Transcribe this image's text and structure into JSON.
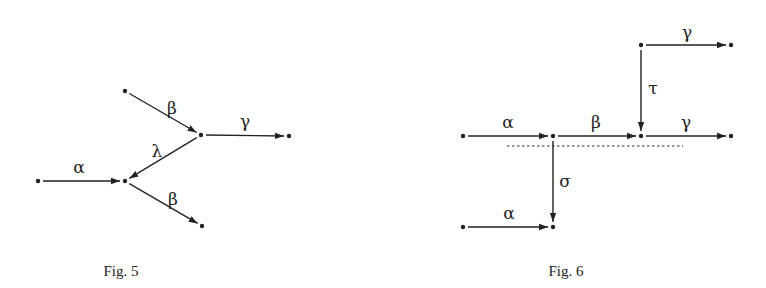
{
  "figures": [
    {
      "id": "fig5",
      "caption": "Fig. 5",
      "caption_pos": [
        121,
        276
      ],
      "nodes": [
        {
          "id": "n1",
          "x": 125,
          "y": 91
        },
        {
          "id": "n2",
          "x": 201,
          "y": 135
        },
        {
          "id": "n3",
          "x": 289,
          "y": 136
        },
        {
          "id": "n4",
          "x": 38,
          "y": 181
        },
        {
          "id": "n5",
          "x": 125,
          "y": 181
        },
        {
          "id": "n6",
          "x": 202,
          "y": 226
        }
      ],
      "edges": [
        {
          "from": "n1",
          "to": "n2",
          "label": "β",
          "label_pos": [
            172,
            114
          ]
        },
        {
          "from": "n2",
          "to": "n3",
          "label": "γ",
          "label_pos": [
            245,
            127
          ]
        },
        {
          "from": "n2",
          "to": "n5",
          "label": "λ",
          "label_pos": [
            157,
            157
          ]
        },
        {
          "from": "n4",
          "to": "n5",
          "label": "α",
          "label_pos": [
            79,
            173
          ]
        },
        {
          "from": "n5",
          "to": "n6",
          "label": "β",
          "label_pos": [
            173,
            205
          ]
        }
      ]
    },
    {
      "id": "fig6",
      "caption": "Fig. 6",
      "caption_pos": [
        566,
        276
      ],
      "nodes": [
        {
          "id": "m1",
          "x": 641,
          "y": 45
        },
        {
          "id": "m2",
          "x": 731,
          "y": 45
        },
        {
          "id": "m3",
          "x": 463,
          "y": 136
        },
        {
          "id": "m4",
          "x": 553,
          "y": 136
        },
        {
          "id": "m5",
          "x": 641,
          "y": 136
        },
        {
          "id": "m6",
          "x": 731,
          "y": 136
        },
        {
          "id": "m7",
          "x": 463,
          "y": 227
        },
        {
          "id": "m8",
          "x": 553,
          "y": 227
        }
      ],
      "edges": [
        {
          "from": "m1",
          "to": "m2",
          "label": "γ",
          "label_pos": [
            687,
            38
          ]
        },
        {
          "from": "m1",
          "to": "m5",
          "label": "τ",
          "label_pos": [
            653,
            94
          ]
        },
        {
          "from": "m3",
          "to": "m4",
          "label": "α",
          "label_pos": [
            508,
            128
          ]
        },
        {
          "from": "m4",
          "to": "m5",
          "label": "β",
          "label_pos": [
            596,
            128
          ]
        },
        {
          "from": "m5",
          "to": "m6",
          "label": "γ",
          "label_pos": [
            686,
            128
          ]
        },
        {
          "from": "m4",
          "to": "m8",
          "label": "σ",
          "label_pos": [
            565,
            187
          ]
        },
        {
          "from": "m7",
          "to": "m8",
          "label": "α",
          "label_pos": [
            509,
            219
          ]
        }
      ],
      "dashed_line": {
        "x1": 507,
        "y1": 146,
        "x2": 683,
        "y2": 146
      }
    }
  ]
}
